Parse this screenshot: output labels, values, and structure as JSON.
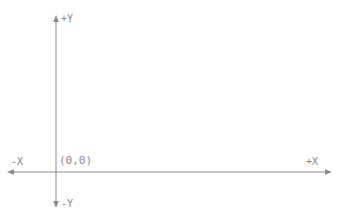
{
  "diagram": {
    "type": "cartesian-axes",
    "background_color": "#ffffff",
    "line_color": "#8a8a8a",
    "text_color": "#8a8a8a",
    "origin": {
      "x": 56,
      "y": 172
    },
    "labels": {
      "positive_y": "+Y",
      "negative_y": "-Y",
      "positive_x": "+X",
      "negative_x": "-X",
      "origin": "(0,0)"
    },
    "axes": [
      {
        "name": "y-axis",
        "orientation": "vertical",
        "start": {
          "x": 56,
          "y": 16
        },
        "end": {
          "x": 56,
          "y": 207
        },
        "arrow_start": true,
        "arrow_end": true
      },
      {
        "name": "x-axis",
        "orientation": "horizontal",
        "start": {
          "x": 8,
          "y": 172
        },
        "end": {
          "x": 331,
          "y": 172
        },
        "arrow_start": true,
        "arrow_end": true
      }
    ]
  }
}
